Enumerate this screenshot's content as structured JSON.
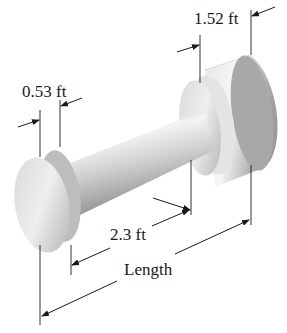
{
  "diagram": {
    "type": "engineering-dimension-drawing",
    "labels": {
      "left_end_width": "0.53 ft",
      "right_end_width": "1.52 ft",
      "shaft_length": "2.3 ft",
      "total_length": "Length"
    },
    "colors": {
      "line": "#1a1a1a",
      "body_light": "#f2f2f2",
      "body_mid": "#c8c8c8",
      "body_dark": "#8c8c8c"
    }
  }
}
